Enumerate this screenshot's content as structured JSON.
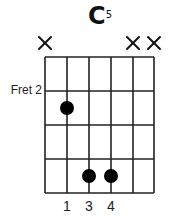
{
  "chord": {
    "name": "C",
    "superscript": "5",
    "fret_label": "Fret 2"
  },
  "grid": {
    "strings": 6,
    "frets_shown": 4,
    "string_x": [
      45,
      67,
      89,
      111,
      133,
      154
    ],
    "fret_y": [
      57,
      91,
      125,
      159,
      193
    ],
    "line_color": "#222222"
  },
  "muted_strings": [
    1,
    5,
    6
  ],
  "dots": [
    {
      "string": 2,
      "fret_row": 2,
      "finger": "1"
    },
    {
      "string": 3,
      "fret_row": 4,
      "finger": "3"
    },
    {
      "string": 4,
      "fret_row": 4,
      "finger": "4"
    }
  ],
  "fingers": [
    "1",
    "3",
    "4"
  ],
  "dot_color": "#000000"
}
